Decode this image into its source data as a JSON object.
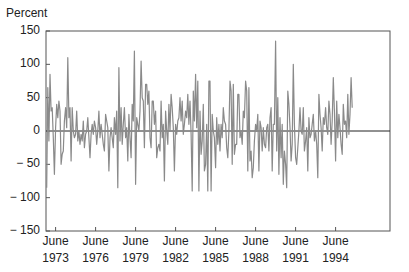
{
  "chart_data": {
    "type": "line",
    "title": "",
    "xlabel": "",
    "ylabel": "Percent",
    "ylim": [
      -150,
      150
    ],
    "yticks": [
      150,
      100,
      50,
      0,
      -50,
      -100,
      -150
    ],
    "ytick_labels": [
      "150",
      "100",
      "50",
      "0",
      "− 50",
      "− 100",
      "− 150"
    ],
    "xticks": [
      {
        "label_line1": "June",
        "label_line2": "1973",
        "year": 1973.42
      },
      {
        "label_line1": "June",
        "label_line2": "1976",
        "year": 1976.42
      },
      {
        "label_line1": "June",
        "label_line2": "1979",
        "year": 1979.42
      },
      {
        "label_line1": "June",
        "label_line2": "1982",
        "year": 1982.42
      },
      {
        "label_line1": "June",
        "label_line2": "1985",
        "year": 1985.42
      },
      {
        "label_line1": "June",
        "label_line2": "1988",
        "year": 1988.42
      },
      {
        "label_line1": "June",
        "label_line2": "1991",
        "year": 1991.42
      },
      {
        "label_line1": "June",
        "label_line2": "1994",
        "year": 1994.42
      }
    ],
    "xlim": [
      1972.7,
      1998.5
    ],
    "grid": false,
    "zero_line": true,
    "legend": null,
    "series": [
      {
        "name": "Percent change",
        "color": "#8a8a8a",
        "x_start": 1972.75,
        "x_step_months": 1,
        "values": [
          -85,
          65,
          -15,
          85,
          30,
          35,
          -10,
          -65,
          5,
          40,
          20,
          45,
          30,
          -50,
          -35,
          -30,
          15,
          35,
          5,
          110,
          20,
          35,
          -45,
          35,
          0,
          -10,
          -5,
          30,
          -15,
          0,
          -20,
          -5,
          -15,
          15,
          -25,
          -5,
          0,
          20,
          -10,
          -40,
          -5,
          10,
          -5,
          15,
          5,
          -20,
          0,
          30,
          -10,
          10,
          -5,
          -20,
          -30,
          25,
          15,
          5,
          -60,
          -10,
          5,
          -10,
          -25,
          20,
          -5,
          30,
          -85,
          95,
          -15,
          35,
          -20,
          10,
          35,
          -10,
          5,
          -45,
          25,
          -10,
          -40,
          40,
          15,
          120,
          -80,
          20,
          10,
          0,
          30,
          105,
          50,
          45,
          -25,
          70,
          70,
          40,
          60,
          -10,
          -25,
          45,
          45,
          10,
          30,
          -40,
          -25,
          -20,
          -30,
          45,
          -10,
          10,
          -75,
          30,
          0,
          -20,
          40,
          0,
          55,
          35,
          5,
          -60,
          10,
          -5,
          15,
          20,
          50,
          15,
          45,
          -5,
          10,
          30,
          20,
          55,
          10,
          45,
          -5,
          -90,
          60,
          15,
          85,
          5,
          75,
          -90,
          30,
          -35,
          -15,
          40,
          -60,
          -50,
          10,
          -90,
          75,
          75,
          -90,
          25,
          0,
          -10,
          -55,
          20,
          -20,
          10,
          -30,
          10,
          -10,
          35,
          15,
          10,
          -25,
          -40,
          0,
          75,
          60,
          -50,
          70,
          -35,
          -20,
          -20,
          55,
          55,
          -10,
          0,
          -20,
          30,
          20,
          75,
          60,
          -60,
          65,
          -45,
          -30,
          -70,
          -55,
          -15,
          10,
          0,
          25,
          -60,
          15,
          5,
          -30,
          5,
          -20,
          -25,
          5,
          10,
          -30,
          20,
          35,
          -60,
          10,
          10,
          135,
          -30,
          50,
          -65,
          20,
          -40,
          10,
          -80,
          -30,
          -50,
          -85,
          60,
          40,
          5,
          -45,
          -20,
          100,
          10,
          -40,
          -50,
          -25,
          0,
          35,
          0,
          -5,
          35,
          -30,
          -15,
          5,
          -60,
          20,
          -10,
          -5,
          10,
          25,
          -15,
          0,
          -20,
          -70,
          55,
          25,
          5,
          -30,
          20,
          10,
          35,
          5,
          -5,
          45,
          25,
          -20,
          15,
          80,
          30,
          -45,
          45,
          -10,
          25,
          5,
          -20,
          -35,
          40,
          10,
          15,
          -10,
          55,
          -5,
          25,
          80,
          35
        ]
      }
    ]
  },
  "labels": {
    "ylabel": "Percent"
  }
}
